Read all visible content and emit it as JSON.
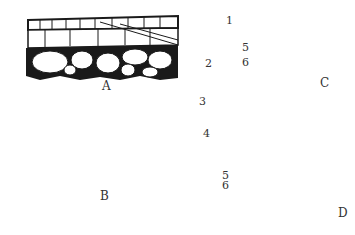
{
  "figure": {
    "panels": [
      {
        "id": "A",
        "label": "A",
        "description": "thin-walled cortex cross-section with cork layer"
      },
      {
        "id": "B",
        "label": "B",
        "description": "thick stippled periderm layers over parenchyma"
      },
      {
        "id": "C",
        "label": "C",
        "description": "narrow section with dark outer layer"
      },
      {
        "id": "D",
        "label": "D",
        "description": "tall column section with stacked cells"
      }
    ],
    "callouts": [
      {
        "number": "1",
        "targets": "outer layer of A and C"
      },
      {
        "number": "2",
        "targets": "inner cell layers of A"
      },
      {
        "number": "3",
        "targets": "outer surface of B and D"
      },
      {
        "number": "4",
        "targets": "bracketed stippled layers of B and D"
      },
      {
        "number": "5",
        "targets": "layer beneath periderm in B, C, D"
      },
      {
        "number": "6",
        "targets": "nucleated cell layers in B, C, D"
      }
    ],
    "colors": {
      "ink": "#1a1a1a",
      "paper": "#ffffff",
      "stipple": "#bdbdbd",
      "label": "#333333"
    }
  }
}
